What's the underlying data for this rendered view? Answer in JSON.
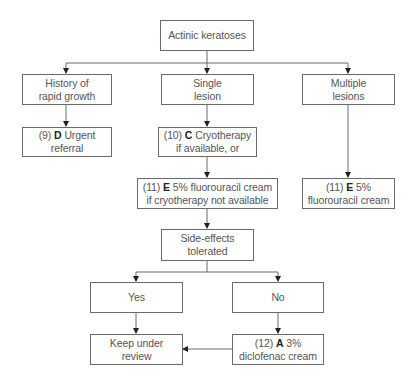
{
  "title": "Actinic keratoses",
  "nodes": {
    "root": {
      "line1": "Actinic keratoses"
    },
    "history": {
      "line1": "History of",
      "line2": "rapid growth"
    },
    "single": {
      "line1": "Single",
      "line2": "lesion"
    },
    "multiple": {
      "line1": "Multiple",
      "line2": "lesions"
    },
    "urgent": {
      "num": "(9)",
      "grade": "D",
      "line1_rest": "Urgent",
      "line2": "referral"
    },
    "cryo": {
      "num": "(10)",
      "grade": "C",
      "line1_rest": "Cryotherapy",
      "line2": "if available, or"
    },
    "fluoro_single": {
      "num": "(11)",
      "grade": "E",
      "line1_rest": "5% fluorouracil cream",
      "line2": "if cryotherapy not available"
    },
    "fluoro_multiple": {
      "num": "(11)",
      "grade": "E",
      "line1_rest": "5%",
      "line2": "fluorouracil cream"
    },
    "side_effects": {
      "line1": "Side-effects",
      "line2": "tolerated"
    },
    "yes": {
      "line1": "Yes"
    },
    "no": {
      "line1": "No"
    },
    "keep": {
      "line1": "Keep under",
      "line2": "review"
    },
    "diclofenac": {
      "num": "(12)",
      "grade": "A",
      "line1_rest": "3%",
      "line2": "diclofenac cream"
    }
  },
  "colors": {
    "stroke": "#6a6a6a",
    "text": "#555555",
    "grade": "#222222"
  }
}
